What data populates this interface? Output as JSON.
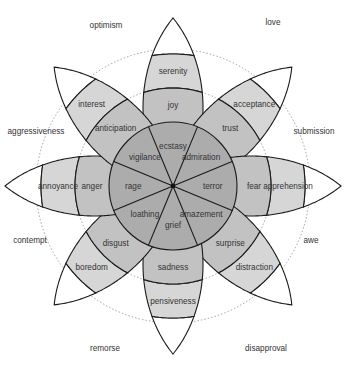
{
  "colors": {
    "inner": "#acacac",
    "middle": "#c2c2c2",
    "outer": "#d6d6d6",
    "tip": "#ffffff",
    "stroke": "#1a1a1a",
    "dashed": "#8a8a8a",
    "text": "#333333"
  },
  "geometry": {
    "center": [
      173,
      186
    ],
    "inner_radius": 64,
    "middle_radius": 98,
    "outer_radius": 132,
    "tip_radius": 168,
    "dashed_radii": [
      98,
      137
    ]
  },
  "petals": [
    {
      "angle": -90,
      "intense": "ecstasy",
      "basic": "joy",
      "mild": "serenity"
    },
    {
      "angle": -45,
      "intense": "admiration",
      "basic": "trust",
      "mild": "acceptance"
    },
    {
      "angle": 0,
      "intense": "terror",
      "basic": "fear",
      "mild": "apprehension"
    },
    {
      "angle": 45,
      "intense": "amazement",
      "basic": "surprise",
      "mild": "distraction"
    },
    {
      "angle": 90,
      "intense": "grief",
      "basic": "sadness",
      "mild": "pensiveness"
    },
    {
      "angle": 135,
      "intense": "loathing",
      "basic": "disgust",
      "mild": "boredom"
    },
    {
      "angle": 180,
      "intense": "rage",
      "basic": "anger",
      "mild": "annoyance"
    },
    {
      "angle": -135,
      "intense": "vigilance",
      "basic": "anticipation",
      "mild": "interest"
    }
  ],
  "dyads": [
    {
      "label": "love",
      "x": 273,
      "y": 22
    },
    {
      "label": "submission",
      "x": 314,
      "y": 131
    },
    {
      "label": "awe",
      "x": 311,
      "y": 240
    },
    {
      "label": "disapproval",
      "x": 266,
      "y": 348
    },
    {
      "label": "remorse",
      "x": 105,
      "y": 348
    },
    {
      "label": "contempt",
      "x": 30,
      "y": 240
    },
    {
      "label": "aggressiveness",
      "x": 36,
      "y": 131
    },
    {
      "label": "optimism",
      "x": 106,
      "y": 25
    }
  ]
}
